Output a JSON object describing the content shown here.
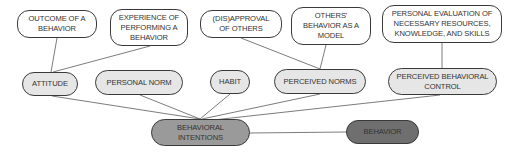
{
  "diagram": {
    "type": "concept-map",
    "colors": {
      "background": "#ffffff",
      "antecedent_fill": "#ffffff",
      "determinant_fill": "#e6e6e6",
      "intentions_fill": "#9a9a9a",
      "behavior_fill": "#6f6f6f",
      "border": "#3a3a3a",
      "line": "#555555"
    },
    "antecedents": [
      {
        "id": "outcome",
        "label": "OUTCOME OF A BEHAVIOR"
      },
      {
        "id": "experience",
        "label": "EXPERIENCE OF PERFORMING A BEHAVIOR"
      },
      {
        "id": "disapproval",
        "label": "(DIS)APPROVAL OF OTHERS"
      },
      {
        "id": "others_model",
        "label": "OTHERS' BEHAVIOR AS A MODEL"
      },
      {
        "id": "evaluation",
        "label": "PERSONAL EVALUATION OF NECESSARY RESOURCES, KNOWLEDGE, AND SKILLS"
      }
    ],
    "determinants": [
      {
        "id": "attitude",
        "label": "ATTITUDE"
      },
      {
        "id": "personal_norm",
        "label": "PERSONAL NORM"
      },
      {
        "id": "habit",
        "label": "HABIT"
      },
      {
        "id": "perceived_norms",
        "label": "PERCEIVED NORMS"
      },
      {
        "id": "pbc",
        "label": "PERCEIVED BEHAVIORAL CONTROL"
      }
    ],
    "intentions": {
      "id": "intentions",
      "label": "BEHAVIORAL INTENTIONS"
    },
    "behavior": {
      "id": "behavior",
      "label": "BEHAVIOR"
    },
    "edges": [
      [
        "outcome",
        "attitude"
      ],
      [
        "experience",
        "attitude"
      ],
      [
        "disapproval",
        "perceived_norms"
      ],
      [
        "others_model",
        "perceived_norms"
      ],
      [
        "evaluation",
        "pbc"
      ],
      [
        "attitude",
        "intentions"
      ],
      [
        "personal_norm",
        "intentions"
      ],
      [
        "habit",
        "intentions"
      ],
      [
        "perceived_norms",
        "intentions"
      ],
      [
        "pbc",
        "intentions"
      ],
      [
        "intentions",
        "behavior"
      ]
    ]
  }
}
